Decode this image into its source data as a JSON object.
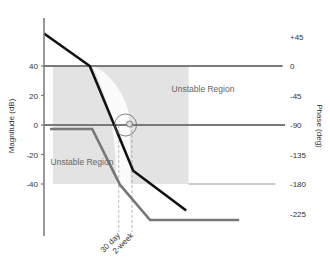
{
  "chart_data": {
    "type": "line",
    "title": "",
    "xlabel": "",
    "x_scale": "log frequency (normalized 0-1, unlabeled)",
    "left_axis": {
      "label": "Magnitude (dB)",
      "ticks": [
        40,
        20,
        0,
        -20,
        -40
      ],
      "tick_labels": [
        "40",
        "20",
        "0",
        "-20",
        "-40"
      ],
      "range": [
        -80,
        65
      ]
    },
    "right_axis": {
      "label": "Phase (deg)",
      "ticks": [
        45,
        0,
        -45,
        -90,
        -135,
        -180,
        -225
      ],
      "tick_labels": [
        "+45",
        "0",
        "-45",
        "-90",
        "-135",
        "-180",
        "-225"
      ],
      "range": [
        -270,
        50
      ]
    },
    "reference_lines": [
      {
        "name": "40 dB / 0 deg",
        "axis": "right",
        "value": 0,
        "from": 0,
        "to": 0.99,
        "color": "#7a7a7a"
      },
      {
        "name": "0 dB / -90 deg",
        "axis": "right",
        "value": -90,
        "from": 0,
        "to": 1.0,
        "color": "#7a7a7a"
      },
      {
        "name": "-180 deg",
        "axis": "right",
        "value": -180,
        "from": 0.6,
        "to": 0.96,
        "color": "#9a9a9a"
      }
    ],
    "series": [
      {
        "name": "Magnitude",
        "axis": "left",
        "color": "#111111",
        "x": [
          0.0,
          0.19,
          0.37,
          0.59
        ],
        "y": [
          62,
          40,
          -31,
          -58
        ]
      },
      {
        "name": "Phase",
        "axis": "right",
        "color": "#777777",
        "x": [
          0.025,
          0.2,
          0.315,
          0.44,
          0.81
        ],
        "y": [
          -96,
          -96,
          -181,
          -235,
          -235
        ]
      }
    ],
    "shaded_region": {
      "x_range": [
        0.037,
        0.6
      ],
      "y_range_dB": [
        40,
        -40
      ],
      "color": "#e3e3e3"
    },
    "annotations": [
      {
        "text": "Unstable Region",
        "position": "upper-right of crossover"
      },
      {
        "text": "Unstable Region",
        "position": "lower-left of crossover"
      },
      {
        "text": "30 day",
        "x": 0.31,
        "type": "vertical-dashed-marker"
      },
      {
        "text": "2-week",
        "x": 0.365,
        "type": "vertical-dashed-marker"
      }
    ],
    "crossover_marker": {
      "x": 0.355,
      "y_dB": 0,
      "shape": "circle"
    },
    "grid": false,
    "legend": "none"
  }
}
